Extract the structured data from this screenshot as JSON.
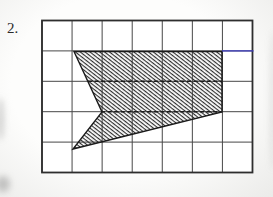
{
  "problem": {
    "number_label": "2."
  },
  "figure": {
    "canvas": {
      "width": 273,
      "height": 197
    },
    "grid": {
      "x": 42,
      "y": 20.5,
      "cols": 7,
      "rows": 5,
      "cell_width": 30.07,
      "cell_height": 30.4,
      "cell_fill": "#ffffff",
      "line_color": "#474747",
      "line_width": 1,
      "border_color": "#2e2e2e",
      "border_width": 1.8
    },
    "polygon": {
      "points": [
        [
          74,
          51.5
        ],
        [
          222,
          51.5
        ],
        [
          222,
          112
        ],
        [
          73,
          149
        ],
        [
          102,
          112
        ]
      ],
      "outline_color": "#1a1a1a",
      "outline_width": 1.4,
      "hatch": {
        "color": "#2f2f2f",
        "spacing": 3,
        "thickness": 1.15,
        "angle_deg": 38
      }
    },
    "emphasized_dashed_lines": [
      {
        "x1": 88,
        "y1": 81.3,
        "x2": 222,
        "y2": 81.3
      },
      {
        "x1": 101,
        "y1": 111.7,
        "x2": 222,
        "y2": 111.7
      }
    ],
    "dash_style": {
      "color": "#1c1c1c",
      "width": 1.6,
      "dasharray": "4 2.6"
    },
    "blue_line": {
      "x1": 222,
      "y1": 50.9,
      "x2": 253.5,
      "y2": 50.9,
      "color": "#3d3dc0",
      "width": 1.3
    }
  }
}
